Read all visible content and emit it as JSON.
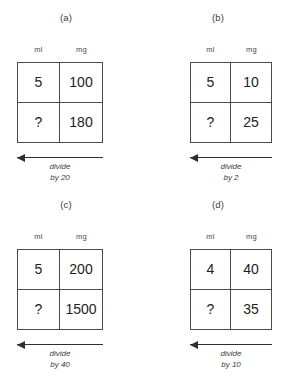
{
  "page": {
    "background": "#ffffff",
    "ink": "#2e2e2e"
  },
  "panels": [
    {
      "caption": "(a)",
      "columns": [
        "ml",
        "mg"
      ],
      "rows": [
        {
          "ml": "5",
          "mg": "100"
        },
        {
          "ml": "?",
          "mg": "180"
        }
      ],
      "arrow": {
        "direction": "left",
        "label_line1": "divide",
        "label_line2": "by 20"
      }
    },
    {
      "caption": "(b)",
      "columns": [
        "ml",
        "mg"
      ],
      "rows": [
        {
          "ml": "5",
          "mg": "10"
        },
        {
          "ml": "?",
          "mg": "25"
        }
      ],
      "arrow": {
        "direction": "left",
        "label_line1": "divide",
        "label_line2": "by 2"
      }
    },
    {
      "caption": "(c)",
      "columns": [
        "ml",
        "mg"
      ],
      "rows": [
        {
          "ml": "5",
          "mg": "200"
        },
        {
          "ml": "?",
          "mg": "1500"
        }
      ],
      "arrow": {
        "direction": "left",
        "label_line1": "divide",
        "label_line2": "by 40"
      }
    },
    {
      "caption": "(d)",
      "columns": [
        "ml",
        "mg"
      ],
      "rows": [
        {
          "ml": "4",
          "mg": "40"
        },
        {
          "ml": "?",
          "mg": "35"
        }
      ],
      "arrow": {
        "direction": "left",
        "label_line1": "divide",
        "label_line2": "by 10"
      }
    }
  ]
}
